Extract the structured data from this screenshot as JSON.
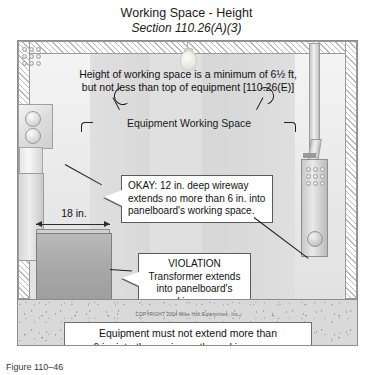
{
  "title": {
    "main": "Working Space - Height",
    "subtitle": "Section 110.26(A)(3)"
  },
  "figure": {
    "header_note_line1": "Height of working space is a minimum of 6½ ft,",
    "header_note_line2": "but not less than top of equipment [110.26(E)]",
    "working_space_label": "Equipment Working Space",
    "dimension_label": "18 in.",
    "callouts": [
      {
        "id": "okay",
        "line1": "OKAY: 12 in. deep wireway",
        "line2": "extends no more than 6 in. into",
        "line3": "panelboard's working space."
      },
      {
        "id": "violation",
        "line1": "VIOLATION",
        "line2": "Transformer extends",
        "line3": "into panelboard's",
        "line4": "working space."
      }
    ],
    "copyright": "COPYRIGHT 2004  Mike Holt Enterprises, Inc.",
    "bottom_banner_line1": "Equipment must not extend more than",
    "bottom_banner_line2": "6 in. into the equipment's working space."
  },
  "caption": "Figure 110–46",
  "colors": {
    "room_fill": "#e9e9e9",
    "working_space_fill": "#d8d8d8",
    "transformer_fill": "#a8a8a8",
    "floor_fill": "#d9d9d9",
    "outline": "#8d8d8d",
    "text": "#111111"
  }
}
